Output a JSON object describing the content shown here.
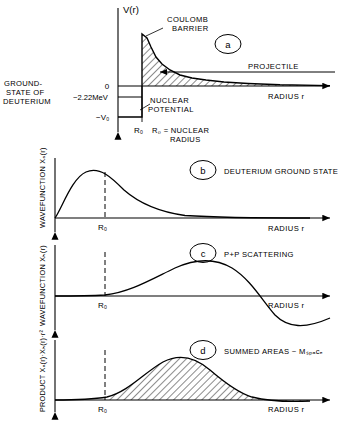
{
  "figure": {
    "panels": [
      {
        "id": "a",
        "label": "a",
        "yaxis_label": "V(r)",
        "xaxis_label": "RADIUS r",
        "annotations": [
          "COULOMB",
          "BARRIER",
          "PROJECTILE",
          "NUCLEAR",
          "POTENTIAL",
          "GROUND-",
          "STATE OF",
          "DEUTERIUM",
          "R₀ = NUCLEAR",
          "RADIUS"
        ],
        "tick_labels": [
          "0",
          "−2.22MeV",
          "−V₀",
          "R₀"
        ]
      },
      {
        "id": "b",
        "label": "b",
        "yaxis_label": "WAVEFUNCTION  Xₐ(r)",
        "xaxis_label": "RADIUS r",
        "caption": "DEUTERIUM GROUND STATE",
        "tick_labels": [
          "R₀"
        ]
      },
      {
        "id": "c",
        "label": "c",
        "yaxis_label": "WAVEFUNCTION  Xₕ(r)",
        "xaxis_label": "RADIUS r",
        "caption": "P+P SCATTERING",
        "tick_labels": [
          "R₀"
        ]
      },
      {
        "id": "d",
        "label": "d",
        "yaxis_label": "PRODUCT  Xₐ(r)·Xₕ(r)·r²",
        "xaxis_label": "RADIUS r",
        "caption": "SUMMED AREAS ~ Mₛₚₐᴄₑ",
        "tick_labels": [
          "R₀"
        ]
      }
    ]
  },
  "colors": {
    "ink": "#000000",
    "background": "#ffffff"
  }
}
